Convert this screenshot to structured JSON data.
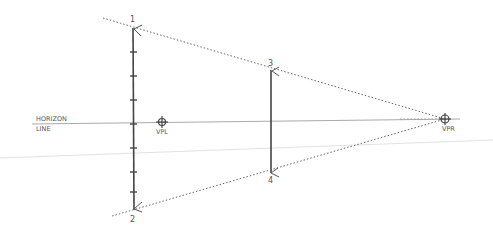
{
  "diagram": {
    "type": "one-point perspective sketch",
    "horizon_label_line1": "HORIZON",
    "horizon_label_line2": "LINE",
    "vpl_label": "VPL",
    "vpr_label": "VPR",
    "points": [
      {
        "id": "1",
        "label": "1",
        "x": 133,
        "y": 28
      },
      {
        "id": "2",
        "label": "2",
        "x": 133,
        "y": 210
      },
      {
        "id": "3",
        "label": "3",
        "x": 271,
        "y": 71
      },
      {
        "id": "4",
        "label": "4",
        "x": 271,
        "y": 172
      }
    ],
    "vanishing_points": [
      {
        "id": "vpl",
        "x": 162,
        "y": 123
      },
      {
        "id": "vpr",
        "x": 445,
        "y": 119
      }
    ],
    "horizon_y": 123,
    "colors": {
      "ink": "#444444",
      "faint": "#bbbbbb",
      "dotted": "#666666"
    }
  }
}
